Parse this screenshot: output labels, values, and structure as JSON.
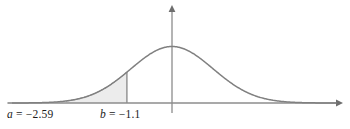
{
  "figure": {
    "background_color": "#ffffff",
    "curve_color": "#808080",
    "axis_color": "#8c8c8c",
    "shade_color": "#ececec",
    "shade_border_color": "#9a9a9a",
    "text_color": "#1a1a1a"
  },
  "labels": {
    "a": {
      "variable": "a",
      "equals": " = ",
      "value": "−2.59",
      "full": "a = −2.59"
    },
    "b": {
      "variable": "b",
      "equals": " = ",
      "value": "−1.1",
      "full": "b = −1.1"
    }
  },
  "chart_data": {
    "type": "area",
    "title": "",
    "subtitle": "",
    "xlabel": "",
    "ylabel": "",
    "grid": false,
    "legend": "none",
    "distribution": "standard normal",
    "mean": 0,
    "std_dev": 1,
    "xlim": [
      -4.0,
      4.0
    ],
    "ylim": [
      0,
      0.45
    ],
    "annotations": [
      {
        "name": "a",
        "label": "a = −2.59",
        "x": -2.59,
        "type": "lower-bound"
      },
      {
        "name": "b",
        "label": "b = −1.1",
        "x": -1.1,
        "type": "upper-bound",
        "vertical_line": true
      }
    ],
    "shaded_region": {
      "from": -2.59,
      "to": -1.1,
      "fill": "#ececec",
      "description": "area under standard normal curve between a and b"
    },
    "axes": {
      "x_axis": {
        "arrow": "right",
        "visible": true,
        "y_value": 0
      },
      "y_axis": {
        "arrow": "up",
        "visible": true,
        "x_value": 0
      }
    },
    "x": [
      -4.0,
      -3.8,
      -3.6,
      -3.4,
      -3.2,
      -3.0,
      -2.8,
      -2.59,
      -2.4,
      -2.2,
      -2.0,
      -1.8,
      -1.6,
      -1.4,
      -1.2,
      -1.1,
      -1.0,
      -0.8,
      -0.6,
      -0.4,
      -0.2,
      0.0,
      0.2,
      0.4,
      0.6,
      0.8,
      1.0,
      1.2,
      1.4,
      1.6,
      1.8,
      2.0,
      2.2,
      2.4,
      2.6,
      2.8,
      3.0,
      3.2,
      3.4,
      3.6,
      3.8,
      4.0
    ],
    "y": [
      0.0001,
      0.0003,
      0.0006,
      0.0012,
      0.0024,
      0.0044,
      0.0079,
      0.0143,
      0.0224,
      0.0355,
      0.054,
      0.079,
      0.1109,
      0.1497,
      0.1942,
      0.2179,
      0.242,
      0.2897,
      0.3332,
      0.3683,
      0.391,
      0.3989,
      0.391,
      0.3683,
      0.3332,
      0.2897,
      0.242,
      0.1942,
      0.1497,
      0.1109,
      0.079,
      0.054,
      0.0355,
      0.0224,
      0.0136,
      0.0079,
      0.0044,
      0.0024,
      0.0012,
      0.0006,
      0.0003,
      0.0001
    ]
  }
}
